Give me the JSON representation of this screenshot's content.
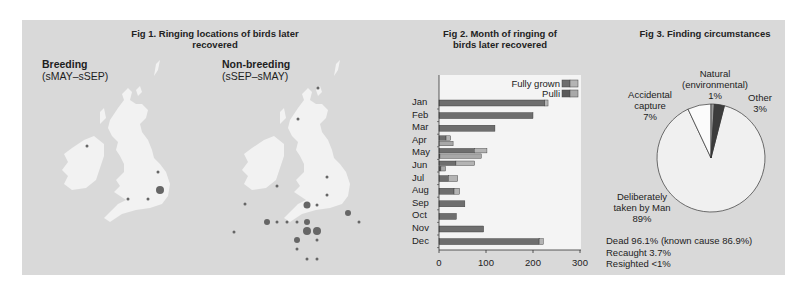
{
  "fig1": {
    "title": "Fig 1. Ringing locations of birds later recovered",
    "breeding": {
      "label": "Breeding",
      "period": "(sMAY–sSEP)",
      "dots": [
        [
          87,
          146,
          1.5
        ],
        [
          158,
          172,
          1.5
        ],
        [
          160,
          190,
          4
        ],
        [
          148,
          199,
          1.5
        ],
        [
          128,
          199,
          1.5
        ]
      ]
    },
    "nonbreeding": {
      "label": "Non-breeding",
      "period": "(sSEP–sMAY)",
      "dots": [
        [
          318,
          88,
          1.5
        ],
        [
          298,
          119,
          1.5
        ],
        [
          327,
          177,
          1.5
        ],
        [
          277,
          186,
          1.5
        ],
        [
          327,
          195,
          1.5
        ],
        [
          307,
          205,
          3.5
        ],
        [
          317,
          205,
          1.5
        ],
        [
          245,
          204,
          1.5
        ],
        [
          348,
          213,
          3
        ],
        [
          277,
          222,
          1.5
        ],
        [
          287,
          222,
          1.5
        ],
        [
          297,
          222,
          1.5
        ],
        [
          307,
          222,
          3
        ],
        [
          359,
          222,
          1.5
        ],
        [
          267,
          222,
          3
        ],
        [
          234,
          232,
          1.5
        ],
        [
          307,
          231,
          4
        ],
        [
          317,
          231,
          4
        ],
        [
          297,
          240,
          3
        ],
        [
          317,
          240,
          1.5
        ],
        [
          297,
          249,
          1.5
        ],
        [
          307,
          259,
          1.5
        ],
        [
          317,
          259,
          1.5
        ]
      ]
    }
  },
  "fig2": {
    "title_line1": "Fig 2. Month of ringing of",
    "title_line2": "birds later recovered",
    "legend": {
      "fully_grown": "Fully grown",
      "pulli": "Pulli"
    },
    "axis_ticks": [
      "0",
      "100",
      "200",
      "300"
    ]
  },
  "fig3": {
    "title": "Fig 3. Finding circumstances",
    "labels": {
      "natural_1": "Natural",
      "natural_2": "(environmental)",
      "natural_3": "1%",
      "accidental_1": "Accidental",
      "accidental_2": "capture",
      "accidental_3": "7%",
      "other_1": "Other",
      "other_2": "3%",
      "deliberate_1": "Deliberately",
      "deliberate_2": "taken by Man",
      "deliberate_3": "89%"
    },
    "stats": [
      "Dead 96.1% (known cause 86.9%)",
      "Recaught 3.7%",
      "Resighted <1%"
    ]
  },
  "colors": {
    "panel": "#d9d9d9",
    "plot_bg": "#f4f4f4",
    "fully_grown_dead": "#6e6e6e",
    "fully_grown_alive": "#b4b4b4",
    "pulli_dead": "#5a5a5a",
    "pulli_alive": "#a8a8a8",
    "dot": "#666666",
    "land": "#f2f2f2"
  },
  "chart_data": [
    {
      "type": "bar",
      "orientation": "horizontal",
      "title": "Fig 2. Month of ringing of birds later recovered",
      "categories": [
        "Jan",
        "Feb",
        "Mar",
        "Apr",
        "May",
        "Jun",
        "Jul",
        "Aug",
        "Sep",
        "Oct",
        "Nov",
        "Dec"
      ],
      "series": [
        {
          "name": "Fully grown (dark)",
          "values": [
            225,
            200,
            119,
            15,
            75,
            0,
            8,
            34,
            55,
            38,
            95,
            213
          ]
        },
        {
          "name": "Fully grown (light)",
          "values": [
            7,
            0,
            0,
            10,
            27,
            0,
            5,
            11,
            0,
            0,
            0,
            9
          ]
        },
        {
          "name": "Pulli (dark)",
          "values": [
            0,
            0,
            0,
            0,
            0,
            0,
            0,
            0,
            0,
            0,
            0,
            0
          ]
        },
        {
          "name": "Pulli (light)",
          "values": [
            0,
            0,
            0,
            0,
            30,
            90,
            40,
            0,
            0,
            0,
            0,
            0
          ]
        }
      ],
      "rows": [
        {
          "month": "Jan",
          "fg": [
            225,
            7
          ],
          "pu": null
        },
        {
          "month": "Feb",
          "fg": [
            200,
            0
          ],
          "pu": null
        },
        {
          "month": "Mar",
          "fg": [
            119,
            0
          ],
          "pu": null
        },
        {
          "month": "Apr",
          "fg": [
            15,
            10
          ],
          "pu": [
            0,
            30
          ]
        },
        {
          "month": "May",
          "fg": [
            75,
            27
          ],
          "pu": [
            2,
            88
          ]
        },
        {
          "month": "Jun",
          "fg": [
            36,
            40
          ],
          "pu": [
            4,
            10
          ]
        },
        {
          "month": "Jul",
          "fg": [
            20,
            20
          ],
          "pu": null
        },
        {
          "month": "Aug",
          "fg": [
            32,
            12
          ],
          "pu": null
        },
        {
          "month": "Sep",
          "fg": [
            55,
            0
          ],
          "pu": null
        },
        {
          "month": "Oct",
          "fg": [
            37,
            0
          ],
          "pu": null
        },
        {
          "month": "Nov",
          "fg": [
            95,
            0
          ],
          "pu": null
        },
        {
          "month": "Dec",
          "fg": [
            213,
            9
          ],
          "pu": null
        }
      ],
      "xlabel": "",
      "ylabel": "",
      "xlim": [
        0,
        300
      ],
      "xticks": [
        0,
        100,
        200,
        300
      ],
      "legend": [
        "Fully grown",
        "Pulli"
      ],
      "legend_position": "top-right"
    },
    {
      "type": "pie",
      "title": "Fig 3. Finding circumstances",
      "categories": [
        "Deliberately taken by Man",
        "Accidental capture",
        "Natural (environmental)",
        "Other"
      ],
      "values": [
        89,
        7,
        1,
        3
      ],
      "notes": [
        "Dead 96.1% (known cause 86.9%)",
        "Recaught 3.7%",
        "Resighted <1%"
      ]
    }
  ]
}
